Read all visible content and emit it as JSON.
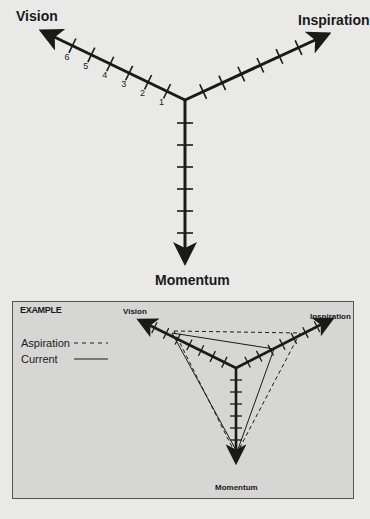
{
  "top_diagram": {
    "axes": [
      {
        "name": "Vision",
        "label": "Vision"
      },
      {
        "name": "Inspiration",
        "label": "Inspiration"
      },
      {
        "name": "Momentum",
        "label": "Momentum"
      }
    ],
    "tick_labels": [
      "1",
      "2",
      "3",
      "4",
      "5",
      "6"
    ],
    "ticks_per_axis": 6
  },
  "example": {
    "title": "EXAMPLE",
    "legend": [
      {
        "name": "Aspiration",
        "label": "Aspiration",
        "style": "dashed"
      },
      {
        "name": "Current",
        "label": "Current",
        "style": "solid"
      }
    ],
    "axes": {
      "vision": "Vision",
      "inspiration": "Inspiration",
      "momentum": "Momentum"
    },
    "ticks_per_axis": 7,
    "series": [
      {
        "name": "Aspiration",
        "values": {
          "Vision": 5,
          "Inspiration": 5,
          "Momentum": 6.5
        }
      },
      {
        "name": "Current",
        "values": {
          "Vision": 5,
          "Inspiration": 3,
          "Momentum": 6
        }
      }
    ]
  },
  "colors": {
    "background": "#e9e9e7",
    "example_box": "#d6d6d4",
    "ink": "#1a1a1a"
  }
}
